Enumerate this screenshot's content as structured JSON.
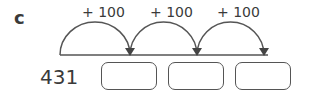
{
  "question": {
    "label": "c",
    "start_value": "431",
    "jumps": [
      {
        "label": "+ 100"
      },
      {
        "label": "+ 100"
      },
      {
        "label": "+ 100"
      }
    ],
    "answer_boxes": [
      {
        "value": ""
      },
      {
        "value": ""
      },
      {
        "value": ""
      }
    ]
  }
}
